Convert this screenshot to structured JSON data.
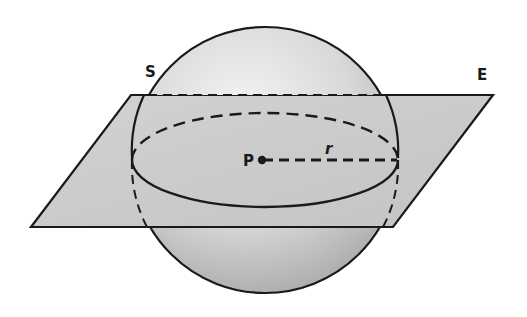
{
  "diagram": {
    "labels": {
      "sphere": "S",
      "plane": "E",
      "center": "P",
      "radius": "r"
    },
    "colors": {
      "stroke": "#1a1a1a",
      "plane_fill": "#c9c9c9",
      "sphere_light": "#f2f2f2",
      "sphere_dark": "#a8a8a8"
    }
  }
}
